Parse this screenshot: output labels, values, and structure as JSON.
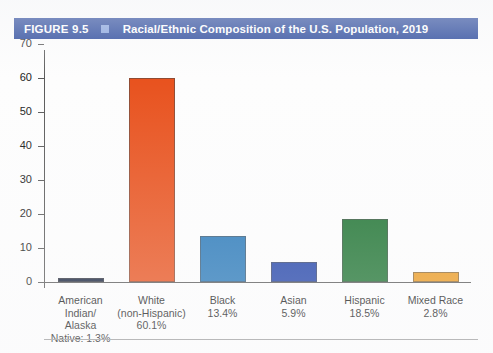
{
  "header": {
    "figure_number": "FIGURE 9.5",
    "marker_icon": "square-marker-icon",
    "title": "Racial/Ethnic Composition of the U.S. Population, 2019",
    "bar_color": "#1f3f96",
    "marker_color": "#7f9ddb",
    "text_color": "#ffffff"
  },
  "chart_data": {
    "type": "bar",
    "title": "Racial/Ethnic Composition of the U.S. Population, 2019",
    "xlabel": "",
    "ylabel": "",
    "ylim": [
      0,
      70
    ],
    "yticks": [
      0,
      10,
      20,
      30,
      40,
      50,
      60,
      70
    ],
    "ytick_labels": [
      "0",
      "10",
      "20",
      "30",
      "40",
      "50",
      "60",
      "70"
    ],
    "grid": false,
    "legend": "none",
    "categories": [
      "American Indian/Alaska Native",
      "White (non-Hispanic)",
      "Black",
      "Asian",
      "Hispanic",
      "Mixed Race"
    ],
    "values": [
      1.3,
      60.1,
      13.4,
      5.9,
      18.5,
      2.8
    ],
    "value_labels": [
      "1.3%",
      "60.1%",
      "13.4%",
      "5.9%",
      "18.5%",
      "2.8%"
    ],
    "colors": [
      "#15213c",
      "#e8521e",
      "#2878b8",
      "#2243a8",
      "#1e7331",
      "#eb9a21"
    ],
    "bars": [
      {
        "name": "american-indian-alaska-native",
        "value": 1.3,
        "color": "#15213c",
        "label_lines": [
          "American",
          "Indian/",
          "Alaska",
          "Native: 1.3%"
        ]
      },
      {
        "name": "white-non-hispanic",
        "value": 60.1,
        "color": "#e8521e",
        "label_lines": [
          "White",
          "(non-Hispanic)",
          "60.1%"
        ]
      },
      {
        "name": "black",
        "value": 13.4,
        "color": "#2878b8",
        "label_lines": [
          "Black",
          "13.4%"
        ]
      },
      {
        "name": "asian",
        "value": 5.9,
        "color": "#2243a8",
        "label_lines": [
          "Asian",
          "5.9%"
        ]
      },
      {
        "name": "hispanic",
        "value": 18.5,
        "color": "#1e7331",
        "label_lines": [
          "Hispanic",
          "18.5%"
        ]
      },
      {
        "name": "mixed-race",
        "value": 2.8,
        "color": "#eb9a21",
        "label_lines": [
          "Mixed Race",
          "2.8%"
        ]
      }
    ]
  }
}
